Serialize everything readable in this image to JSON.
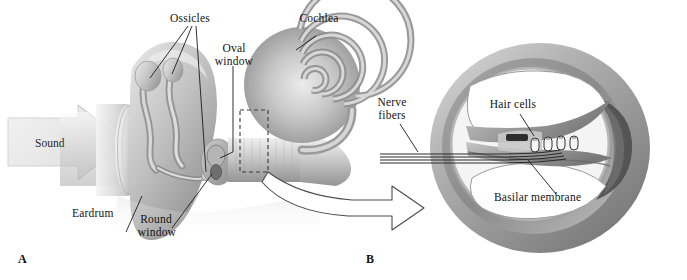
{
  "figure": {
    "background_color": "#ffffff",
    "panels": [
      {
        "id": "A",
        "letter": "A",
        "caption": "Outer, middle and inner ear with cochlea"
      },
      {
        "id": "B",
        "letter": "B",
        "caption": "Cross-section of the cochlear duct"
      }
    ]
  },
  "panel_a": {
    "letter": "A",
    "labels": {
      "ossicles": "Ossicles",
      "oval_window": "Oval\nwindow",
      "oval_window_line1": "Oval",
      "oval_window_line2": "window",
      "cochlea": "Cochlea",
      "sound": "Sound",
      "eardrum": "Eardrum",
      "round_window_line1": "Round",
      "round_window_line2": "window"
    },
    "colors": {
      "tissue_light": "#e6e6e6",
      "tissue_mid": "#bfbfbf",
      "tissue_dark": "#8f8f8f",
      "tissue_shadow": "#6f6f6f",
      "arrow_fill": "#e9e9e9",
      "arrow_stroke": "#cfcfcf",
      "leader_line": "#1a1a1a",
      "dashed_box": "#3a3a3a"
    }
  },
  "panel_b": {
    "letter": "B",
    "labels": {
      "nerve_fibers_line1": "Nerve",
      "nerve_fibers_line2": "fibers",
      "hair_cells": "Hair cells",
      "basilar_membrane": "Basilar membrane"
    },
    "colors": {
      "ring_outer": "#9a9a9a",
      "ring_mid": "#b4b4b4",
      "ring_inner": "#7e7e7e",
      "ring_highlight": "#d5d5d5",
      "chamber": "#ffffff",
      "dark_crevice": "#4a4a4a",
      "membrane": "#8a8a8a",
      "hair_cell": "#f2f2f2",
      "hair_cell_stroke": "#3a3a3a",
      "nerve_line": "#2b2b2b",
      "leader_line": "#1a1a1a"
    },
    "hair_cell_count": 4,
    "nerve_fiber_count": 4
  },
  "connector": {
    "type": "outline-block-arrow",
    "from": "panel-a-dashed-box",
    "to": "panel-b",
    "fill": "#ffffff",
    "stroke": "#4a4a4a"
  }
}
